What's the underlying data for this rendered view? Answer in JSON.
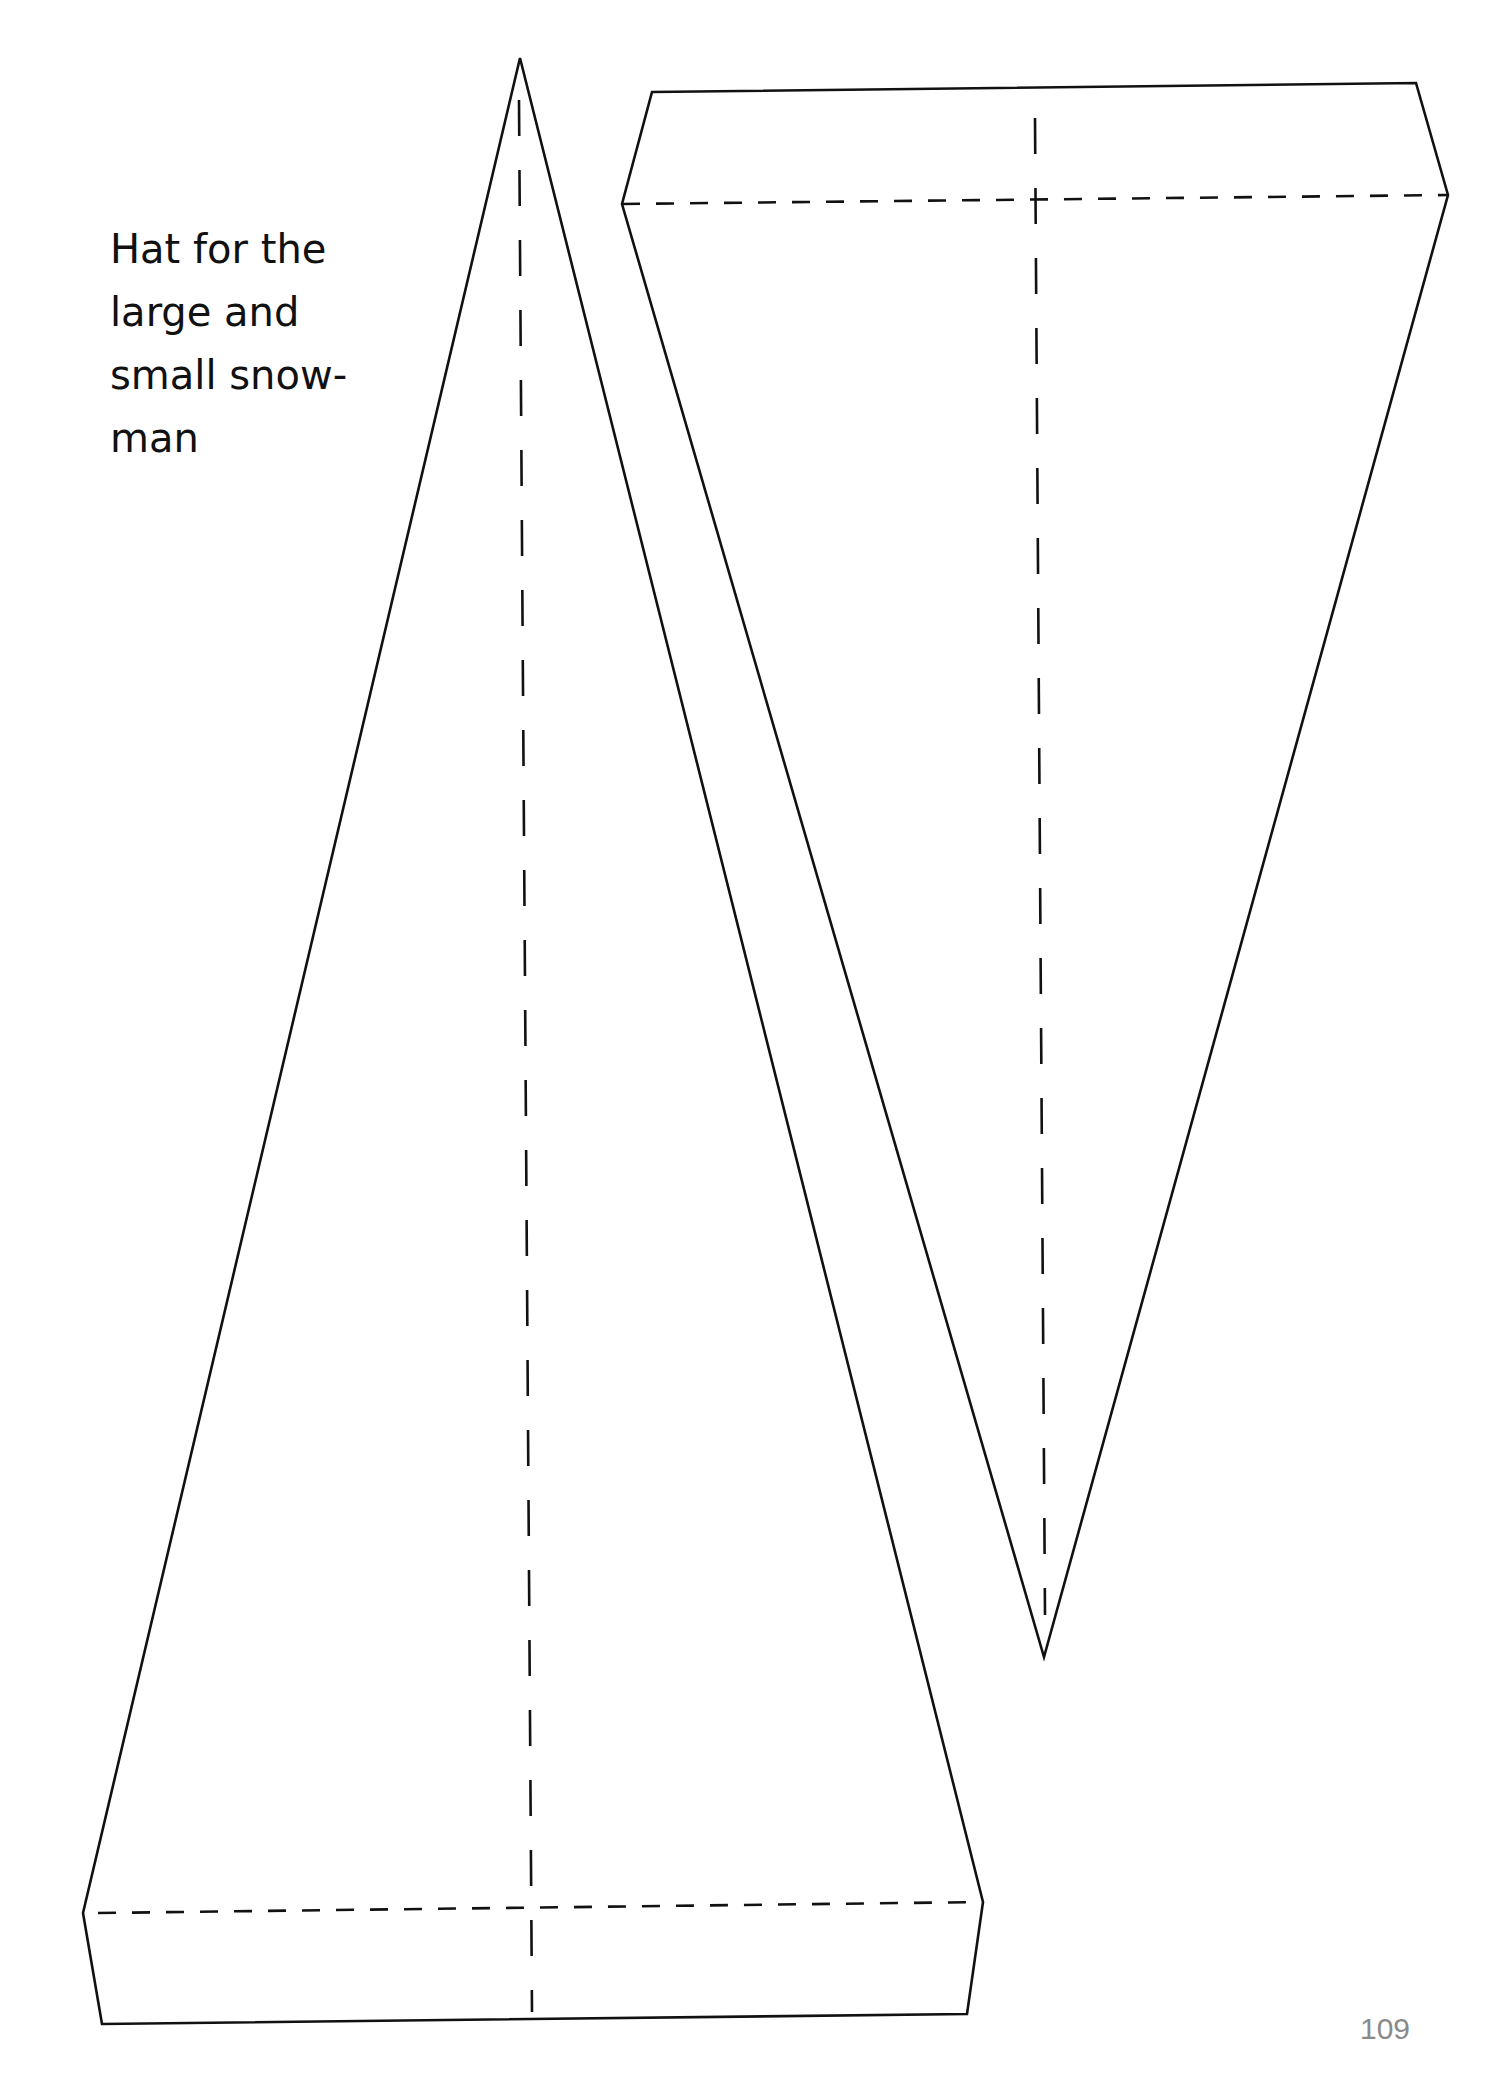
{
  "page": {
    "title_lines": [
      "Hat for the",
      "large and",
      "small snow-",
      "man"
    ],
    "page_number": "109",
    "colors": {
      "line": "#111111",
      "page_number": "#8a8a8a",
      "background": "#ffffff"
    }
  },
  "templates": [
    {
      "name": "large-hat",
      "description": "Tall triangular hat template with fold strip at the base",
      "cut_outline": [
        [
          520,
          58
        ],
        [
          983,
          1902
        ],
        [
          967,
          2014
        ],
        [
          102,
          2024
        ],
        [
          83,
          1913
        ]
      ],
      "fold_lines": {
        "horizontal": [
          [
            98,
            1913
          ],
          [
            983,
            1902
          ]
        ],
        "vertical": [
          [
            519,
            100
          ],
          [
            532,
            2012
          ]
        ]
      }
    },
    {
      "name": "small-hat",
      "description": "Inverted triangular hat template with fold strip at the top",
      "cut_outline": [
        [
          652,
          92
        ],
        [
          1416,
          83
        ],
        [
          1448,
          195
        ],
        [
          1044,
          1657
        ],
        [
          622,
          204
        ]
      ],
      "fold_lines": {
        "horizontal": [
          [
            622,
            204
          ],
          [
            1448,
            195
          ]
        ],
        "vertical": [
          [
            1035,
            118
          ],
          [
            1045,
            1615
          ]
        ]
      }
    }
  ]
}
